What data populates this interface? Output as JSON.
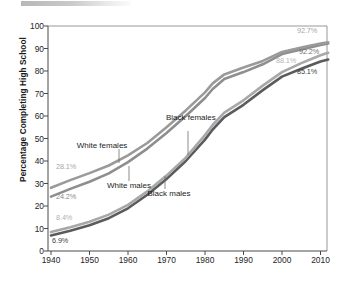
{
  "chart_data": {
    "type": "line",
    "title": "",
    "xlabel": "",
    "ylabel": "Percentage Completing High School",
    "xlim": [
      1940,
      2012
    ],
    "ylim": [
      0,
      100
    ],
    "grid": false,
    "legend_position": "inline-annotations",
    "x_ticks": [
      "1940",
      "1950",
      "1960",
      "1970",
      "1980",
      "1990",
      "2000",
      "2010"
    ],
    "y_ticks": [
      "0",
      "10",
      "20",
      "30",
      "40",
      "50",
      "60",
      "70",
      "80",
      "90",
      "100"
    ],
    "x": [
      1940,
      1945,
      1950,
      1955,
      1960,
      1965,
      1970,
      1975,
      1980,
      1982,
      1985,
      1990,
      1995,
      2000,
      2005,
      2010,
      2012
    ],
    "series": [
      {
        "name": "White females",
        "color": "#9a9a9a",
        "start_value": 28.1,
        "end_value": 92.7,
        "start_label": "28.1%",
        "end_label": "92.7%",
        "values": [
          28.1,
          31.5,
          34.6,
          38.0,
          42.5,
          48.0,
          55.0,
          62.5,
          70.5,
          74.5,
          78.5,
          81.5,
          84.5,
          88.5,
          90.5,
          92.2,
          92.7
        ]
      },
      {
        "name": "White males",
        "color": "#8e8e8e",
        "start_value": 24.2,
        "end_value": 92.2,
        "start_label": "24.2%",
        "end_label": "92.2%",
        "values": [
          24.2,
          27.6,
          30.8,
          34.5,
          39.5,
          45.5,
          52.5,
          60.0,
          68.0,
          72.0,
          76.5,
          79.5,
          83.0,
          87.5,
          89.5,
          91.6,
          92.2
        ]
      },
      {
        "name": "Black females",
        "color": "#a8a8a8",
        "start_value": 8.4,
        "end_value": 88.1,
        "start_label": "8.4%",
        "end_label": "88.1%",
        "values": [
          8.4,
          10.6,
          13.0,
          16.2,
          20.5,
          26.5,
          33.5,
          41.5,
          51.5,
          56.0,
          61.5,
          67.0,
          73.5,
          79.5,
          83.5,
          87.0,
          88.1
        ]
      },
      {
        "name": "Black males",
        "color": "#5b5b5b",
        "start_value": 6.9,
        "end_value": 85.1,
        "start_label": "6.9%",
        "end_label": "85.1%",
        "values": [
          6.9,
          9.0,
          11.4,
          14.6,
          19.0,
          25.0,
          32.0,
          40.0,
          49.5,
          54.0,
          59.5,
          65.0,
          71.5,
          77.5,
          81.0,
          84.2,
          85.1
        ]
      }
    ],
    "annotations": [
      {
        "text": "White females",
        "target_series": "White females"
      },
      {
        "text": "White males",
        "target_series": "White males"
      },
      {
        "text": "Black females",
        "target_series": "Black females"
      },
      {
        "text": "Black males",
        "target_series": "Black males"
      }
    ]
  }
}
